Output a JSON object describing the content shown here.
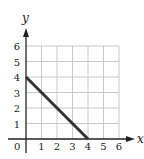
{
  "chart_data": {
    "type": "line",
    "title": "",
    "xlabel": "x",
    "ylabel": "y",
    "xlim": [
      0,
      6
    ],
    "ylim": [
      0,
      6
    ],
    "grid": true,
    "x_ticks": [
      "1",
      "2",
      "3",
      "4",
      "5",
      "6"
    ],
    "y_ticks": [
      "1",
      "2",
      "3",
      "4",
      "5",
      "6"
    ],
    "origin_label": "0",
    "series": [
      {
        "name": "line",
        "x": [
          0,
          4
        ],
        "y": [
          4,
          0
        ]
      }
    ]
  },
  "colors": {
    "grid": "#c8c8c8",
    "axis": "#222222",
    "line": "#333333"
  }
}
